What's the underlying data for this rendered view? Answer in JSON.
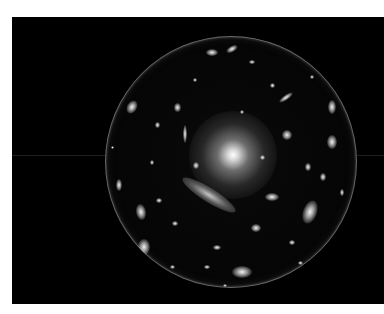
{
  "image": {
    "description": "Galaxy cluster viewed through a spherical lens on a black background",
    "background_color": "#ffffff",
    "panel_color": "#000000"
  },
  "panel": {
    "x": 12,
    "y": 17,
    "width": 372,
    "height": 287
  },
  "sphere": {
    "cx": 219,
    "cy": 145,
    "r": 126
  },
  "core": {
    "cx": 221,
    "cy": 138,
    "r": 44
  },
  "streaks": [
    {
      "cx": 197,
      "cy": 178,
      "w": 62,
      "h": 14,
      "rot": 32
    },
    {
      "cx": 88,
      "cy": 152,
      "w": 4,
      "h": 26,
      "rot": 0
    }
  ],
  "galaxies": [
    {
      "cx": 298,
      "cy": 195,
      "w": 14,
      "h": 24,
      "rot": 20
    },
    {
      "cx": 230,
      "cy": 255,
      "w": 20,
      "h": 12,
      "rot": 0
    },
    {
      "cx": 220,
      "cy": 32,
      "w": 12,
      "h": 6,
      "rot": -30
    },
    {
      "cx": 200,
      "cy": 35,
      "w": 12,
      "h": 7,
      "rot": 0
    },
    {
      "cx": 120,
      "cy": 90,
      "w": 10,
      "h": 14,
      "rot": 30
    },
    {
      "cx": 129,
      "cy": 195,
      "w": 10,
      "h": 16,
      "rot": -10
    },
    {
      "cx": 132,
      "cy": 230,
      "w": 12,
      "h": 16,
      "rot": 0
    },
    {
      "cx": 107,
      "cy": 168,
      "w": 6,
      "h": 12,
      "rot": 0
    },
    {
      "cx": 320,
      "cy": 90,
      "w": 8,
      "h": 14,
      "rot": 0
    },
    {
      "cx": 320,
      "cy": 125,
      "w": 10,
      "h": 14,
      "rot": 0
    },
    {
      "cx": 275,
      "cy": 118,
      "w": 10,
      "h": 10,
      "rot": 0
    },
    {
      "cx": 260,
      "cy": 180,
      "w": 14,
      "h": 8,
      "rot": 0
    },
    {
      "cx": 274,
      "cy": 80,
      "w": 16,
      "h": 5,
      "rot": -35
    },
    {
      "cx": 165,
      "cy": 90,
      "w": 7,
      "h": 9,
      "rot": 0
    },
    {
      "cx": 173,
      "cy": 117,
      "w": 4,
      "h": 18,
      "rot": 0
    },
    {
      "cx": 145,
      "cy": 108,
      "w": 5,
      "h": 6,
      "rot": 0
    },
    {
      "cx": 184,
      "cy": 148,
      "w": 6,
      "h": 7,
      "rot": 0
    },
    {
      "cx": 163,
      "cy": 206,
      "w": 6,
      "h": 5,
      "rot": 0
    },
    {
      "cx": 296,
      "cy": 150,
      "w": 6,
      "h": 8,
      "rot": 0
    },
    {
      "cx": 311,
      "cy": 160,
      "w": 6,
      "h": 8,
      "rot": 0
    },
    {
      "cx": 244,
      "cy": 211,
      "w": 10,
      "h": 8,
      "rot": 0
    },
    {
      "cx": 280,
      "cy": 225,
      "w": 6,
      "h": 5,
      "rot": 0
    },
    {
      "cx": 160,
      "cy": 250,
      "w": 5,
      "h": 4,
      "rot": 0
    },
    {
      "cx": 195,
      "cy": 250,
      "w": 6,
      "h": 4,
      "rot": 0
    },
    {
      "cx": 260,
      "cy": 68,
      "w": 5,
      "h": 5,
      "rot": 0
    },
    {
      "cx": 183,
      "cy": 63,
      "w": 4,
      "h": 4,
      "rot": 0
    },
    {
      "cx": 140,
      "cy": 145,
      "w": 4,
      "h": 5,
      "rot": 0
    },
    {
      "cx": 250,
      "cy": 140,
      "w": 5,
      "h": 5,
      "rot": 0
    },
    {
      "cx": 288,
      "cy": 246,
      "w": 5,
      "h": 4,
      "rot": 0
    },
    {
      "cx": 213,
      "cy": 268,
      "w": 4,
      "h": 3,
      "rot": 0
    },
    {
      "cx": 147,
      "cy": 183,
      "w": 6,
      "h": 5,
      "rot": 0
    },
    {
      "cx": 330,
      "cy": 175,
      "w": 4,
      "h": 7,
      "rot": 0
    },
    {
      "cx": 120,
      "cy": 60,
      "w": 5,
      "h": 5,
      "rot": 0
    },
    {
      "cx": 240,
      "cy": 45,
      "w": 6,
      "h": 4,
      "rot": 0
    },
    {
      "cx": 300,
      "cy": 60,
      "w": 4,
      "h": 4,
      "rot": 0
    },
    {
      "cx": 100,
      "cy": 130,
      "w": 3,
      "h": 3,
      "rot": 0
    },
    {
      "cx": 230,
      "cy": 95,
      "w": 4,
      "h": 4,
      "rot": 0
    },
    {
      "cx": 205,
      "cy": 230,
      "w": 8,
      "h": 5,
      "rot": 0
    }
  ],
  "horizontal_artifact": {
    "y": 138,
    "x1": 0,
    "x2": 372
  }
}
